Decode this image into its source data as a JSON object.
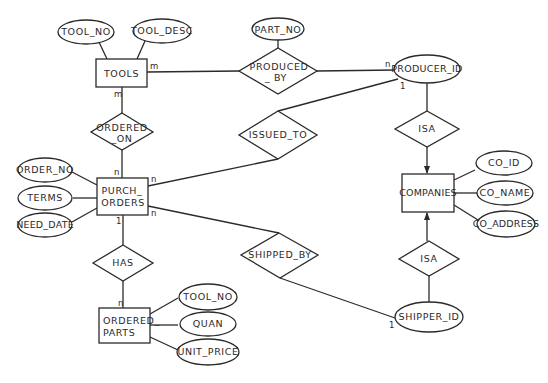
{
  "diagram": {
    "type": "entity-relationship",
    "entities": {
      "tools": "TOOLS",
      "purch_orders_1": "PURCH_",
      "purch_orders_2": "ORDERS",
      "ordered_parts_1": "ORDERED_",
      "ordered_parts_2": "PARTS",
      "companies": "COMPANIES"
    },
    "relationships": {
      "produced_by_1": "PRODUCED",
      "produced_by_2": "_ BY",
      "ordered_on_1": "ORDERED",
      "ordered_on_2": "_ON",
      "issued_to": "ISSUED_TO",
      "has": "HAS",
      "shipped_by": "SHIPPED_BY",
      "isa_top": "ISA",
      "isa_bottom": "ISA"
    },
    "attributes": {
      "tool_no": "TOOL_NO",
      "tool_desc": "TOOL_DESC",
      "part_no": "PART_NO",
      "producer_id": "PRODUCER_ID",
      "order_no": "ORDER_NO",
      "terms": "TERMS",
      "need_date": "NEED_DATE",
      "co_id": "CO_ID",
      "co_name": "CO_NAME",
      "co_address": "CO_ADDRESS",
      "shipper_id": "SHIPPER_ID",
      "op_tool_no": "TOOL_NO",
      "quan": "QUAN",
      "unit_price": "UNIT_PRICE"
    },
    "cardinalities": {
      "tools_produced": "m",
      "tools_ordered": "m",
      "producer_produced": "n",
      "producer_issued": "1",
      "po_ordered": "n",
      "po_issued": "n",
      "po_shipped": "n",
      "po_has": "1",
      "op_has": "n",
      "shipper_shipped": "1"
    }
  }
}
